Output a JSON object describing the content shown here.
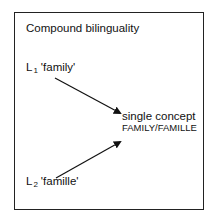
{
  "title": "Compound bilinguality",
  "l1": {
    "base": "L",
    "sub": "1",
    "word": "'family'"
  },
  "l2": {
    "base": "L",
    "sub": "2",
    "word": "'famille'"
  },
  "concept": {
    "line1": "single concept",
    "line2": "FAMILY/FAMILLE"
  },
  "colors": {
    "line": "#111111",
    "border": "#222222",
    "background": "#ffffff"
  }
}
